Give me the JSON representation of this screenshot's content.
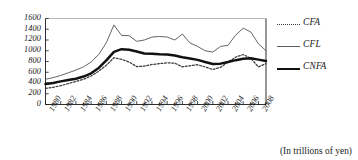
{
  "caption": "(In trillions of yen)",
  "legend": {
    "position": "right",
    "items": [
      {
        "label": "CFA",
        "style": "dotted",
        "name": "cfa"
      },
      {
        "label": "CFL",
        "style": "thin",
        "name": "cfl"
      },
      {
        "label": "CNFA",
        "style": "thick",
        "name": "cnfa"
      }
    ]
  },
  "axes": {
    "y_ticks": [
      "1600",
      "1400",
      "1200",
      "1000",
      "800",
      "600",
      "400",
      "200",
      "0"
    ],
    "x_ticks": [
      "1980",
      "1982",
      "1984",
      "1986",
      "1988",
      "1990",
      "1992",
      "1994",
      "1996",
      "1998",
      "2000",
      "2002",
      "2004",
      "2006",
      "2008"
    ]
  },
  "chart_data": {
    "type": "line",
    "title": "",
    "subtitle": "",
    "xlabel": "",
    "ylabel": "",
    "unit_note": "(In trillions of yen)",
    "grid": false,
    "legend_position": "right",
    "xlim": [
      1980,
      2009
    ],
    "ylim": [
      0,
      1600
    ],
    "ytick_step": 200,
    "xtick_step_labeled": 2,
    "xtick_step_minor": 1,
    "x": [
      1980,
      1981,
      1982,
      1983,
      1984,
      1985,
      1986,
      1987,
      1988,
      1989,
      1990,
      1991,
      1992,
      1993,
      1994,
      1995,
      1996,
      1997,
      1998,
      1999,
      2000,
      2001,
      2002,
      2003,
      2004,
      2005,
      2006,
      2007,
      2008,
      2009
    ],
    "series": [
      {
        "name": "CFA",
        "style": "dotted",
        "color": "#3a3a3a",
        "values": [
          300,
          320,
          350,
          390,
          430,
          470,
          530,
          620,
          730,
          870,
          840,
          790,
          705,
          715,
          745,
          760,
          775,
          770,
          700,
          720,
          740,
          700,
          650,
          690,
          790,
          880,
          930,
          860,
          700,
          760
        ]
      },
      {
        "name": "CFL",
        "style": "thin",
        "color": "#5d5d5d",
        "values": [
          470,
          500,
          540,
          590,
          640,
          700,
          790,
          930,
          1150,
          1480,
          1285,
          1280,
          1175,
          1200,
          1255,
          1265,
          1255,
          1200,
          1310,
          1145,
          1080,
          1000,
          975,
          1080,
          1100,
          1290,
          1420,
          1350,
          1130,
          1000
        ]
      },
      {
        "name": "CNFA",
        "style": "thick",
        "color": "#111111",
        "values": [
          380,
          400,
          430,
          455,
          480,
          520,
          580,
          680,
          820,
          980,
          1030,
          1020,
          985,
          950,
          945,
          935,
          930,
          910,
          880,
          855,
          830,
          790,
          755,
          760,
          790,
          825,
          850,
          860,
          835,
          810
        ]
      }
    ]
  }
}
